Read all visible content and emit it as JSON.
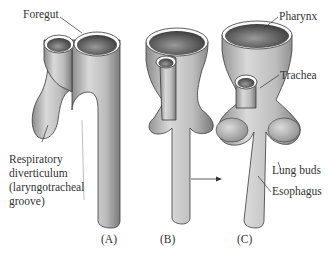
{
  "figure": {
    "panels": [
      {
        "id": "A",
        "label": "(A)"
      },
      {
        "id": "B",
        "label": "(B)"
      },
      {
        "id": "C",
        "label": "(C)"
      }
    ],
    "labels": {
      "foregut": "Foregut",
      "respiratory_1": "Respiratory",
      "respiratory_2": "diverticulum",
      "respiratory_3": "(laryngotracheal",
      "respiratory_4": "groove)",
      "pharynx": "Pharynx",
      "trachea": "Trachea",
      "lung_buds": "Lung buds",
      "esophagus": "Esophagus"
    },
    "colors": {
      "tissue_light": "#d8d8d8",
      "tissue_mid": "#a9a9a9",
      "tissue_dark": "#6a6a6a",
      "outline": "#3a3a3a"
    }
  }
}
